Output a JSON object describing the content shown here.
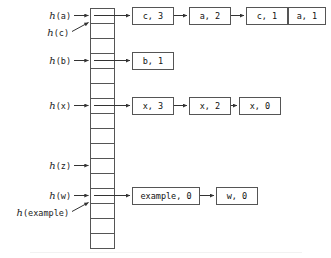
{
  "diagram": {
    "type": "hash-table-chaining",
    "colors": {
      "stroke": "#555555",
      "text": "#111111",
      "background": "#ffffff"
    },
    "table": {
      "name": "hash-table-array",
      "slot_count": 16,
      "x": 90,
      "y": 8,
      "width": 24,
      "slot_height": 15
    },
    "pointers": [
      {
        "label_fn": "h",
        "label_arg": "(a)",
        "slot": 0,
        "style": "straight"
      },
      {
        "label_fn": "h",
        "label_arg": "(c)",
        "slot": 0,
        "style": "diagonal"
      },
      {
        "label_fn": "h",
        "label_arg": "(b)",
        "slot": 3,
        "style": "straight"
      },
      {
        "label_fn": "h",
        "label_arg": "(x)",
        "slot": 6,
        "style": "straight"
      },
      {
        "label_fn": "h",
        "label_arg": "(z)",
        "slot": 10,
        "style": "straight"
      },
      {
        "label_fn": "h",
        "label_arg": "(w)",
        "slot": 12,
        "style": "straight"
      },
      {
        "label_fn": "h",
        "label_arg": "(example)",
        "slot": 12,
        "style": "diagonal"
      }
    ],
    "chains": [
      {
        "slot": 0,
        "nodes": [
          {
            "text": "c, 3",
            "x": 132,
            "width": 42
          },
          {
            "text": "a, 2",
            "x": 189,
            "width": 42
          },
          {
            "text": "c, 1",
            "x": 246,
            "width": 42
          },
          {
            "text": "a, 1",
            "x": 288,
            "width": 38
          }
        ]
      },
      {
        "slot": 3,
        "nodes": [
          {
            "text": "b, 1",
            "x": 132,
            "width": 42
          }
        ]
      },
      {
        "slot": 6,
        "nodes": [
          {
            "text": "x, 3",
            "x": 132,
            "width": 42
          },
          {
            "text": "x, 2",
            "x": 189,
            "width": 42
          },
          {
            "text": "x, 0",
            "x": 239,
            "width": 42
          }
        ]
      },
      {
        "slot": 12,
        "nodes": [
          {
            "text": "example, 0",
            "x": 132,
            "width": 68
          },
          {
            "text": "w, 0",
            "x": 216,
            "width": 42
          }
        ]
      }
    ]
  }
}
